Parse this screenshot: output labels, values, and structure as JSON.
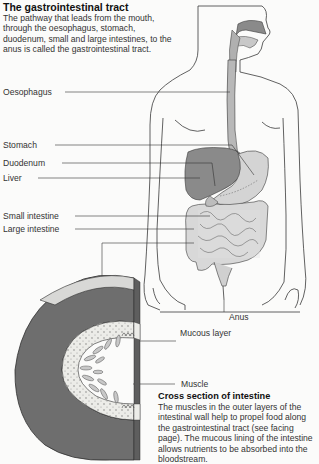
{
  "intro": {
    "title": "The gastrointestinal tract",
    "body": "The pathway that leads from the mouth, through the oesophagus, stomach, duodenum, small and large intestines, to the anus is called the gastrointestinal tract."
  },
  "labels": {
    "oesophagus": "Oesophagus",
    "stomach": "Stomach",
    "duodenum": "Duodenum",
    "liver": "Liver",
    "small_intestine": "Small intestine",
    "large_intestine": "Large intestine",
    "anus": "Anus",
    "mucous_layer": "Mucous layer",
    "muscle": "Muscle"
  },
  "cross_section": {
    "title": "Cross section of intestine",
    "body": "The muscles in the outer layers of the intestinal wall help to propel food along the gastrointestinal tract (see facing page). The mucous lining of the intestine allows nutrients to be absorbed into the bloodstream."
  },
  "colors": {
    "liver": "#8a8a8a",
    "organ_light": "#d6d6d6",
    "muscle_dark": "#6e6e6e",
    "mucous_light": "#e9e9e6",
    "outline": "#3a3a3a",
    "background": "#fbfbfa"
  }
}
